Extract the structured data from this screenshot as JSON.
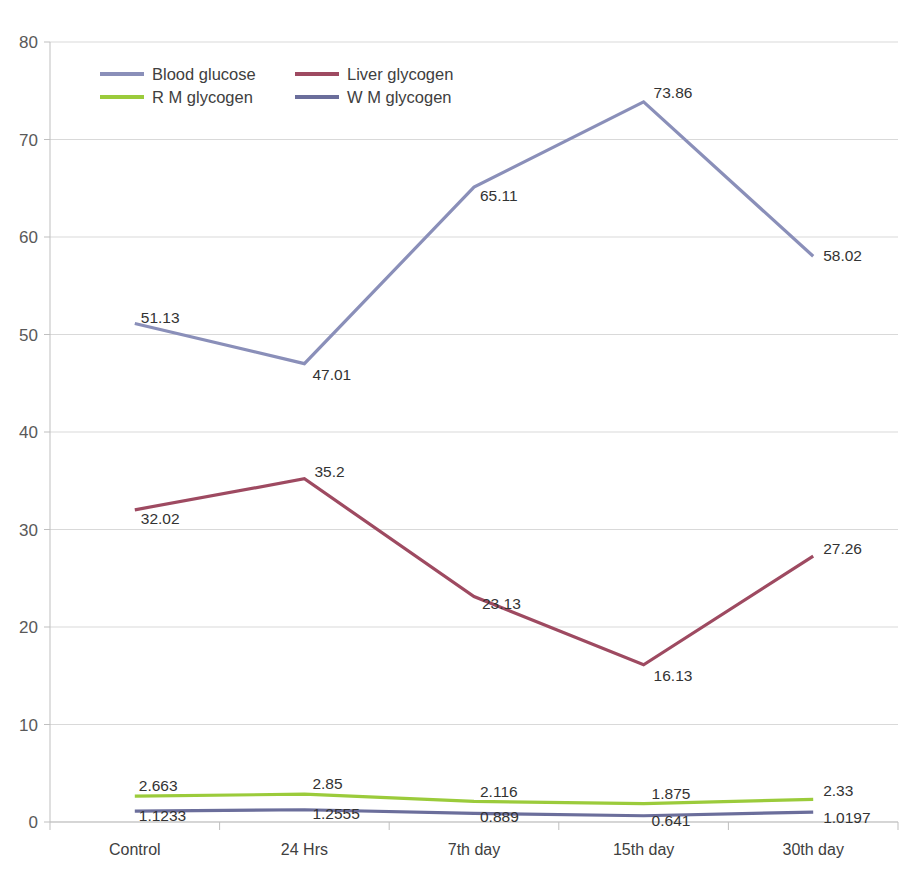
{
  "chart_data": {
    "type": "line",
    "title": "",
    "subtitle": "",
    "xlabel": "",
    "ylabel": "",
    "categories": [
      "Control",
      "24 Hrs",
      "7th day",
      "15th day",
      "30th day"
    ],
    "ylim": [
      0,
      80
    ],
    "y_ticks": [
      0,
      10,
      20,
      30,
      40,
      50,
      60,
      70,
      80
    ],
    "y_tick_labels": [
      "0",
      "10",
      "20",
      "30",
      "40",
      "50",
      "60",
      "70",
      "80"
    ],
    "grid": "horizontal",
    "legend_position": "inside-top-left",
    "series": [
      {
        "name": "Blood glucose",
        "color": "#8A8FB9",
        "values": [
          51.13,
          47.01,
          65.11,
          73.86,
          58.02
        ],
        "labels": [
          "51.13",
          "47.01",
          "65.11",
          "73.86",
          "58.02"
        ]
      },
      {
        "name": "Liver glycogen",
        "color": "#9E4A61",
        "values": [
          32.02,
          35.2,
          23.13,
          16.13,
          27.26
        ],
        "labels": [
          "32.02",
          "35.2",
          "23.13",
          "16.13",
          "27.26"
        ]
      },
      {
        "name": "R M glycogen",
        "color": "#9BCB3B",
        "values": [
          2.663,
          2.85,
          2.116,
          1.875,
          2.33
        ],
        "labels": [
          "2.663",
          "2.85",
          "2.116",
          "1.875",
          "2.33"
        ]
      },
      {
        "name": "W M glycogen",
        "color": "#6B6E9B",
        "values": [
          1.1233,
          1.2555,
          0.889,
          0.641,
          1.0197
        ],
        "labels": [
          "1.1233",
          "1.2555",
          "0.889",
          "0.641",
          "1.0197"
        ]
      }
    ]
  },
  "colors": {
    "background": "#ffffff",
    "gridline": "#d9d9d9",
    "axis": "#bfbfbf",
    "text": "#404040",
    "blood_glucose": "#8A8FB9",
    "liver_glycogen": "#9E4A61",
    "rm_glycogen": "#9BCB3B",
    "wm_glycogen": "#6B6E9B"
  }
}
